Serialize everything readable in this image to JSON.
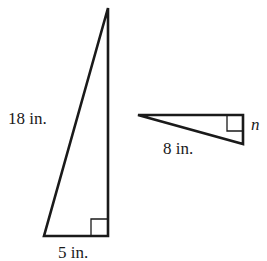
{
  "diagram": {
    "type": "similar-right-triangles",
    "stroke_color": "#1a1a1a",
    "large_triangle": {
      "hypotenuse_label": "18 in.",
      "base_label": "5 in.",
      "right_angle_marker": true
    },
    "small_triangle": {
      "hypotenuse_label": "8 in.",
      "side_label": "n",
      "right_angle_marker": true
    }
  }
}
